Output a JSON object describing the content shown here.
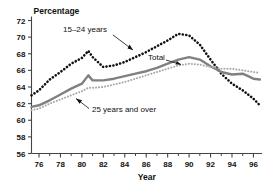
{
  "chart_data": {
    "type": "line",
    "title": "",
    "ylabel": "Percentage",
    "xlabel": "Year",
    "ylim": [
      56,
      72
    ],
    "xlim": [
      1975.3,
      1996.8
    ],
    "ytick_labels": [
      "56",
      "58",
      "60",
      "62",
      "64",
      "66",
      "68",
      "70",
      "72"
    ],
    "ytick_values": [
      56,
      58,
      60,
      62,
      64,
      66,
      68,
      70,
      72
    ],
    "xtick_labels": [
      "76",
      "78",
      "80",
      "82",
      "84",
      "86",
      "88",
      "90",
      "92",
      "94",
      "96"
    ],
    "xtick_values": [
      1976,
      1978,
      1980,
      1982,
      1984,
      1986,
      1988,
      1990,
      1992,
      1994,
      1996
    ],
    "minor_xticks": [
      1977,
      1979,
      1981,
      1983,
      1985,
      1987,
      1989,
      1991,
      1993,
      1995
    ],
    "grid": false,
    "legend_position": "inline-annotations",
    "x": [
      1975.3,
      1976,
      1977,
      1978,
      1979,
      1980,
      1980.6,
      1981,
      1982,
      1983,
      1984,
      1985,
      1986,
      1987,
      1988,
      1989,
      1990,
      1991,
      1992,
      1993,
      1994,
      1995,
      1996,
      1996.6
    ],
    "series": [
      {
        "name": "15–24 years",
        "style": "dotted",
        "color": "#111111",
        "values": [
          63.0,
          63.6,
          64.9,
          65.8,
          66.8,
          67.5,
          68.35,
          67.6,
          66.4,
          66.6,
          67.0,
          67.6,
          68.2,
          68.9,
          69.6,
          70.4,
          70.2,
          69.1,
          67.3,
          65.6,
          64.4,
          63.6,
          62.6,
          61.8
        ]
      },
      {
        "name": "Total",
        "style": "solid",
        "color": "#808080",
        "values": [
          61.6,
          61.8,
          62.4,
          63.1,
          63.8,
          64.4,
          65.4,
          64.8,
          64.8,
          65.0,
          65.3,
          65.6,
          65.9,
          66.3,
          66.8,
          67.3,
          67.6,
          67.3,
          66.5,
          65.8,
          65.5,
          65.6,
          65.0,
          64.9
        ]
      },
      {
        "name": "25 years and over",
        "style": "dotted",
        "color": "#a8a8a8",
        "values": [
          61.2,
          61.4,
          62.0,
          62.5,
          63.0,
          63.5,
          63.9,
          63.9,
          64.0,
          64.3,
          64.6,
          65.0,
          65.4,
          65.8,
          66.2,
          66.6,
          66.8,
          66.7,
          66.4,
          66.2,
          66.2,
          66.0,
          65.8,
          65.7
        ]
      }
    ],
    "annotations": [
      {
        "name": "annotation-15-24-years",
        "text": "15–24 years",
        "x": 63,
        "y": 32
      },
      {
        "name": "annotation-total",
        "text": "Total",
        "x": 148,
        "y": 60
      },
      {
        "name": "annotation-25-years-and-over",
        "text": "25 years and over",
        "x": 92,
        "y": 112
      }
    ]
  }
}
